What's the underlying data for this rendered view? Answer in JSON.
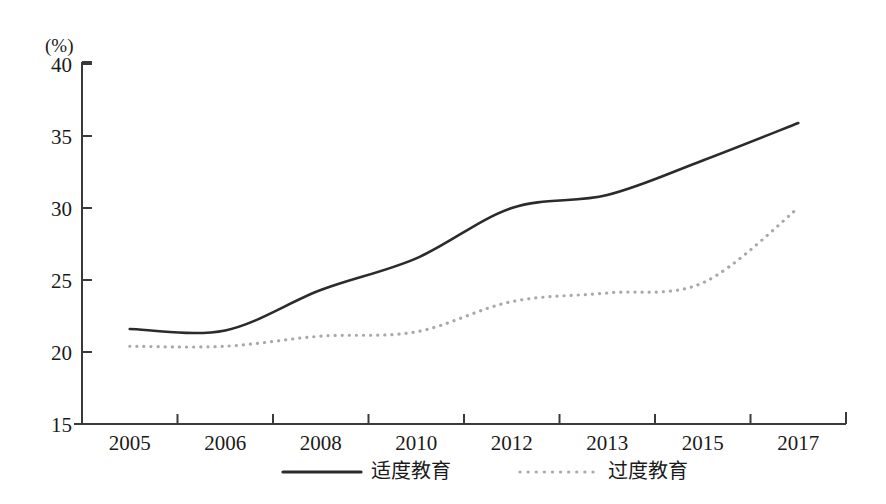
{
  "chart_data": {
    "type": "line",
    "title": "",
    "xlabel": "",
    "ylabel": "",
    "unit_label": "(%)",
    "grid": false,
    "legend_position": "bottom",
    "x": [
      2005,
      2006,
      2008,
      2010,
      2012,
      2013,
      2015,
      2017
    ],
    "categories": [
      "2005",
      "2006",
      "2008",
      "2010",
      "2012",
      "2013",
      "2015",
      "2017"
    ],
    "xtick_labels": [
      "2005",
      "2006",
      "2008",
      "2010",
      "2012",
      "2013",
      "2015",
      "2017"
    ],
    "ytick_labels": [
      "15",
      "20",
      "25",
      "30",
      "35",
      "40"
    ],
    "yticks": [
      15,
      20,
      25,
      30,
      35,
      40
    ],
    "ylim": [
      15,
      40
    ],
    "series": [
      {
        "name": "适度教育",
        "style": "solid",
        "color": "#2b2b2b",
        "values": [
          21.6,
          21.5,
          24.3,
          26.5,
          30.0,
          30.9,
          33.3,
          35.9
        ]
      },
      {
        "name": "过度教育",
        "style": "dotted",
        "color": "#a9a9a9",
        "values": [
          20.4,
          20.4,
          21.1,
          21.4,
          23.5,
          24.1,
          24.8,
          30.0
        ]
      }
    ]
  },
  "legend": {
    "items": [
      {
        "label": "适度教育",
        "style": "solid",
        "color": "#2b2b2b"
      },
      {
        "label": "过度教育",
        "style": "dotted",
        "color": "#a9a9a9"
      }
    ]
  },
  "axes": {
    "unit_label": "(%)",
    "y_labels": [
      "40",
      "35",
      "30",
      "25",
      "20",
      "15"
    ],
    "x_labels": [
      "2005",
      "2006",
      "2008",
      "2010",
      "2012",
      "2013",
      "2015",
      "2017"
    ]
  },
  "colors": {
    "solid_series": "#2b2b2b",
    "dotted_series": "#a9a9a9",
    "axis": "#3a3a3a",
    "background": "#ffffff"
  }
}
